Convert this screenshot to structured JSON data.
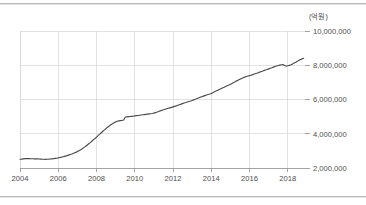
{
  "chart_data": {
    "type": "line",
    "title": "",
    "subtitle": "",
    "unit_label": "(억원)",
    "xlabel": "",
    "ylabel": "",
    "xlim": [
      2004.0,
      2018.9
    ],
    "ylim": [
      2000000,
      10000000
    ],
    "grid": true,
    "legend": false,
    "legend_position": "none",
    "xticks": [
      2004,
      2006,
      2008,
      2010,
      2012,
      2014,
      2016,
      2018
    ],
    "xtick_labels": [
      "2004",
      "2006",
      "2008",
      "2010",
      "2012",
      "2014",
      "2016",
      "2018"
    ],
    "yticks": [
      2000000,
      4000000,
      6000000,
      8000000,
      10000000
    ],
    "ytick_labels": [
      "2,000,000",
      "4,000,000",
      "6,000,000",
      "8,000,000",
      "10,000,000"
    ],
    "line_color": "#4a4a4a",
    "grid_color": "#d6d6d6",
    "axis_color": "#9a9a9a",
    "series": [
      {
        "name": "total",
        "x": [
          2004.0,
          2004.08,
          2004.17,
          2004.25,
          2004.33,
          2004.42,
          2004.5,
          2004.58,
          2004.67,
          2004.75,
          2004.83,
          2004.92,
          2005.0,
          2005.08,
          2005.17,
          2005.25,
          2005.33,
          2005.42,
          2005.5,
          2005.58,
          2005.67,
          2005.75,
          2005.83,
          2005.92,
          2006.0,
          2006.08,
          2006.17,
          2006.25,
          2006.33,
          2006.42,
          2006.5,
          2006.58,
          2006.67,
          2006.75,
          2006.83,
          2006.92,
          2007.0,
          2007.08,
          2007.17,
          2007.25,
          2007.33,
          2007.42,
          2007.5,
          2007.58,
          2007.67,
          2007.75,
          2007.83,
          2007.92,
          2008.0,
          2008.08,
          2008.17,
          2008.25,
          2008.33,
          2008.42,
          2008.5,
          2008.58,
          2008.67,
          2008.75,
          2008.83,
          2008.92,
          2009.0,
          2009.08,
          2009.17,
          2009.25,
          2009.33,
          2009.42,
          2009.5,
          2009.58,
          2009.67,
          2009.75,
          2009.83,
          2009.92,
          2010.0,
          2010.08,
          2010.17,
          2010.25,
          2010.33,
          2010.42,
          2010.5,
          2010.58,
          2010.67,
          2010.75,
          2010.83,
          2010.92,
          2011.0,
          2011.08,
          2011.17,
          2011.25,
          2011.33,
          2011.42,
          2011.5,
          2011.58,
          2011.67,
          2011.75,
          2011.83,
          2011.92,
          2012.0,
          2012.08,
          2012.17,
          2012.25,
          2012.33,
          2012.42,
          2012.5,
          2012.58,
          2012.67,
          2012.75,
          2012.83,
          2012.92,
          2013.0,
          2013.08,
          2013.17,
          2013.25,
          2013.33,
          2013.42,
          2013.5,
          2013.58,
          2013.67,
          2013.75,
          2013.83,
          2013.92,
          2014.0,
          2014.08,
          2014.17,
          2014.25,
          2014.33,
          2014.42,
          2014.5,
          2014.58,
          2014.67,
          2014.75,
          2014.83,
          2014.92,
          2015.0,
          2015.08,
          2015.17,
          2015.25,
          2015.33,
          2015.42,
          2015.5,
          2015.58,
          2015.67,
          2015.75,
          2015.83,
          2015.92,
          2016.0,
          2016.08,
          2016.17,
          2016.25,
          2016.33,
          2016.42,
          2016.5,
          2016.58,
          2016.67,
          2016.75,
          2016.83,
          2016.92,
          2017.0,
          2017.08,
          2017.17,
          2017.25,
          2017.33,
          2017.42,
          2017.5,
          2017.58,
          2017.67,
          2017.75,
          2017.83,
          2017.92,
          2018.0,
          2018.08,
          2018.17,
          2018.25,
          2018.33,
          2018.42,
          2018.5,
          2018.58,
          2018.67,
          2018.75,
          2018.83
        ],
        "values": [
          2510000,
          2520000,
          2535000,
          2545000,
          2550000,
          2548000,
          2545000,
          2542000,
          2538000,
          2535000,
          2532000,
          2530000,
          2525000,
          2518000,
          2512000,
          2508000,
          2505000,
          2508000,
          2515000,
          2525000,
          2535000,
          2545000,
          2558000,
          2572000,
          2590000,
          2610000,
          2632000,
          2655000,
          2680000,
          2708000,
          2738000,
          2768000,
          2800000,
          2835000,
          2872000,
          2912000,
          2960000,
          3010000,
          3065000,
          3125000,
          3190000,
          3258000,
          3330000,
          3405000,
          3482000,
          3560000,
          3640000,
          3722000,
          3805000,
          3890000,
          3975000,
          4060000,
          4145000,
          4228000,
          4308000,
          4385000,
          4458000,
          4525000,
          4588000,
          4645000,
          4695000,
          4730000,
          4752000,
          4768000,
          4778000,
          4800000,
          4960000,
          4985000,
          5000000,
          5010000,
          5018000,
          5028000,
          5040000,
          5055000,
          5068000,
          5082000,
          5095000,
          5108000,
          5120000,
          5132000,
          5145000,
          5158000,
          5170000,
          5185000,
          5205000,
          5235000,
          5268000,
          5300000,
          5335000,
          5368000,
          5398000,
          5428000,
          5458000,
          5485000,
          5512000,
          5540000,
          5570000,
          5600000,
          5630000,
          5662000,
          5695000,
          5728000,
          5760000,
          5792000,
          5822000,
          5852000,
          5882000,
          5912000,
          5945000,
          5980000,
          6018000,
          6055000,
          6092000,
          6128000,
          6162000,
          6195000,
          6228000,
          6258000,
          6288000,
          6318000,
          6352000,
          6400000,
          6450000,
          6498000,
          6545000,
          6590000,
          6632000,
          6675000,
          6718000,
          6760000,
          6802000,
          6845000,
          6890000,
          6938000,
          6988000,
          7038000,
          7088000,
          7138000,
          7185000,
          7230000,
          7272000,
          7308000,
          7340000,
          7368000,
          7392000,
          7420000,
          7452000,
          7485000,
          7518000,
          7552000,
          7585000,
          7618000,
          7652000,
          7688000,
          7722000,
          7755000,
          7788000,
          7822000,
          7855000,
          7890000,
          7925000,
          7958000,
          7988000,
          8010000,
          8028000,
          8042000,
          7990000,
          7952000,
          7968000,
          7995000,
          8030000,
          8075000,
          8125000,
          8178000,
          8232000,
          8285000,
          8330000,
          8372000,
          8410000
        ]
      }
    ]
  },
  "plot_geometry": {
    "left": 20,
    "right": 305,
    "top": 31,
    "bottom": 168
  }
}
